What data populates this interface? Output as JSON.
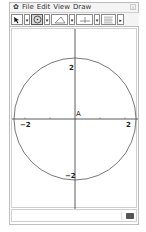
{
  "menubar": {
    "logo": "✿",
    "items": [
      "File",
      "Edit",
      "View",
      "Draw"
    ],
    "close_label": "x"
  },
  "toolbar": {
    "tools": [
      {
        "name": "pointer-tool",
        "icon": "pointer-icon",
        "selected": false
      },
      {
        "name": "circle-tool",
        "icon": "circle-icon",
        "selected": true
      },
      {
        "name": "triangle-tool",
        "icon": "triangle-icon",
        "selected": false
      },
      {
        "name": "axes-tool",
        "icon": "perpendicular-icon",
        "selected": false
      },
      {
        "name": "grid-tool",
        "icon": "grid-icon",
        "selected": false
      }
    ],
    "more_label": "▸"
  },
  "graph": {
    "point_label": "A",
    "x_ticks": [
      "−2",
      "2"
    ],
    "y_ticks": [
      "2",
      "−2"
    ],
    "circle": {
      "center": [
        0,
        0
      ],
      "radius": 2.5
    }
  },
  "status": {
    "text": ""
  }
}
